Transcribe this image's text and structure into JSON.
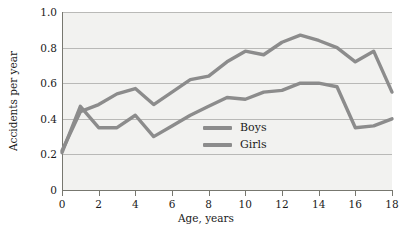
{
  "chart_data": {
    "type": "line",
    "title": "",
    "xlabel": "Age, years",
    "ylabel": "Accidents per year",
    "xlim": [
      0,
      18
    ],
    "ylim": [
      0,
      1.0
    ],
    "grid": true,
    "legend_position": "inside-center",
    "x_ticks": [
      0,
      2,
      4,
      6,
      8,
      10,
      12,
      14,
      16,
      18
    ],
    "x_tick_labels": [
      "0",
      "2",
      "4",
      "6",
      "8",
      "10",
      "12",
      "14",
      "16",
      "18"
    ],
    "y_ticks": [
      0,
      0.2,
      0.4,
      0.6,
      0.8,
      1.0
    ],
    "y_tick_labels": [
      "0",
      "0.2",
      "0.4",
      "0.6",
      "0.8",
      "1.0"
    ],
    "x": [
      0,
      1,
      2,
      3,
      4,
      5,
      6,
      7,
      8,
      9,
      10,
      11,
      12,
      13,
      14,
      15,
      16,
      17,
      18
    ],
    "series": [
      {
        "name": "Boys",
        "color": "#8c8c8c",
        "values": [
          0.22,
          0.44,
          0.48,
          0.54,
          0.57,
          0.48,
          0.55,
          0.62,
          0.64,
          0.72,
          0.78,
          0.76,
          0.83,
          0.87,
          0.84,
          0.8,
          0.72,
          0.78,
          0.55
        ]
      },
      {
        "name": "Girls",
        "color": "#8c8c8c",
        "values": [
          0.21,
          0.47,
          0.35,
          0.35,
          0.42,
          0.3,
          0.36,
          0.42,
          0.47,
          0.52,
          0.51,
          0.55,
          0.56,
          0.6,
          0.6,
          0.58,
          0.35,
          0.36,
          0.4
        ]
      }
    ]
  },
  "legend": {
    "entries": [
      {
        "label": "Boys"
      },
      {
        "label": "Girls"
      }
    ]
  },
  "axes": {
    "x_title": "Age, years",
    "y_title": "Accidents per year"
  },
  "colors": {
    "line": "#8c8c8c",
    "plot_background": "#f2f2f0",
    "gridline": "#b9b9b7",
    "axis": "#77776f",
    "text": "#1a1a1a"
  }
}
